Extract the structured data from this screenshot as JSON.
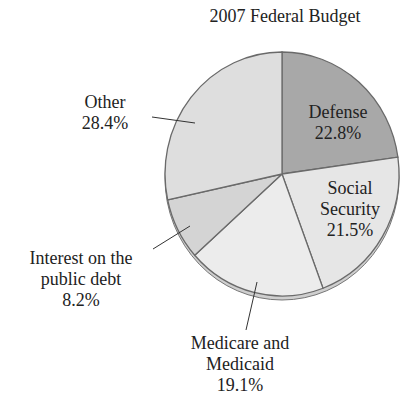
{
  "chart_data": {
    "type": "pie",
    "title": "2007 Federal Budget",
    "categories": [
      "Defense",
      "Social Security",
      "Medicare and Medicaid",
      "Interest on the public debt",
      "Other"
    ],
    "values": [
      22.8,
      21.5,
      19.1,
      8.2,
      28.4
    ],
    "unit": "%",
    "colors": [
      "#a8a8a8",
      "#e6e6e6",
      "#ececec",
      "#d4d4d4",
      "#dedede"
    ],
    "start_angle": "12 o'clock",
    "direction": "clockwise",
    "legend": "none (direct labels)"
  },
  "labels": {
    "defense": {
      "name": "Defense",
      "value": "22.8%"
    },
    "social_security": {
      "line1": "Social",
      "line2": "Security",
      "value": "21.5%"
    },
    "medicare": {
      "line1": "Medicare and",
      "line2": "Medicaid",
      "value": "19.1%"
    },
    "interest": {
      "line1": "Interest on the",
      "line2": "public debt",
      "value": "8.2%"
    },
    "other": {
      "name": "Other",
      "value": "28.4%"
    }
  }
}
